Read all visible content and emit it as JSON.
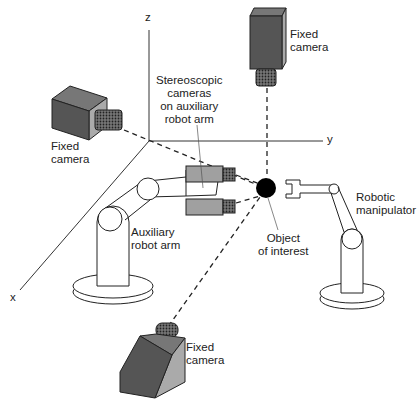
{
  "axes": {
    "x": "x",
    "y": "y",
    "z": "z"
  },
  "labels": {
    "fixed_camera_top": "Fixed\ncamera",
    "fixed_camera_left": "Fixed\ncamera",
    "fixed_camera_bottom": "Fixed\ncamera",
    "stereo": "Stereoscopic\ncameras\non auxiliary\nrobot arm",
    "aux_arm": "Auxiliary\nrobot arm",
    "object": "Object\nof interest",
    "manipulator": "Robotic\nmanipulator"
  },
  "colors": {
    "camera_body": "#555555",
    "camera_side": "#9a9a9a",
    "stereo_body": "#a0a0a0",
    "object": "#000000",
    "line": "#222222"
  }
}
